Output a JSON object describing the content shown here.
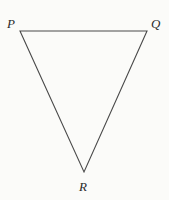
{
  "figure": {
    "kind": "geometry-diagram",
    "shape": "triangle",
    "background_color": "#fbfbf9",
    "stroke_color": "#4a4a4a",
    "stroke_width": 1.1,
    "fill": "none",
    "canvas": {
      "width": 169,
      "height": 200
    }
  },
  "vertices": [
    {
      "id": "P",
      "label": "P",
      "x": 20,
      "y": 31,
      "label_x": 7,
      "label_y": 17,
      "position": "top-left"
    },
    {
      "id": "Q",
      "label": "Q",
      "x": 147,
      "y": 31,
      "label_x": 151,
      "label_y": 17,
      "position": "top-right"
    },
    {
      "id": "R",
      "label": "R",
      "x": 84,
      "y": 172,
      "label_x": 79,
      "label_y": 180,
      "position": "bottom-apex"
    }
  ],
  "edges": [
    {
      "id": "PQ",
      "from": "P",
      "to": "Q",
      "x1": 20,
      "y1": 31,
      "x2": 147,
      "y2": 31
    },
    {
      "id": "QR",
      "from": "Q",
      "to": "R",
      "x1": 147,
      "y1": 31,
      "x2": 84,
      "y2": 172
    },
    {
      "id": "RP",
      "from": "R",
      "to": "P",
      "x1": 84,
      "y1": 172,
      "x2": 20,
      "y2": 31
    }
  ],
  "polygon_points": "20,31 147,31 84,172"
}
